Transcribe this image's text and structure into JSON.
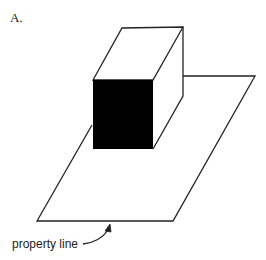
{
  "figure": {
    "panel_label": "A.",
    "annotations": [
      {
        "text": "property line",
        "points_to": "front edge of lot"
      }
    ],
    "elements": {
      "building": "rectangular box (isometric view)",
      "lot": "parallelogram plane representing property"
    },
    "colors": {
      "stroke": "#222222",
      "background": "#ffffff"
    }
  }
}
